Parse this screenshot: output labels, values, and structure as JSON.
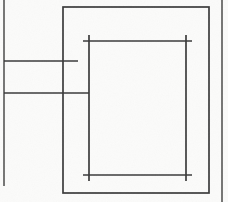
{
  "drawing": {
    "title": "Technical line drawing",
    "description": "Orthographic line diagram: nested rectangles with construction lines",
    "canvas": {
      "width": 228,
      "height": 202,
      "background_color": "#fbfbfa",
      "ink_color": "#3a3a3a",
      "secondary_ink_color": "#4a4a48",
      "stroke_width": 1.7
    },
    "elements": [
      {
        "name": "left-border-line",
        "kind": "line",
        "label": "Left vertical border line",
        "x1": 4,
        "y1": 0,
        "x2": 4,
        "y2": 186
      },
      {
        "name": "right-border-line",
        "kind": "line",
        "label": "Right vertical border line",
        "x1": 222,
        "y1": 0,
        "x2": 222,
        "y2": 202
      },
      {
        "name": "upper-horizontal-line",
        "kind": "line",
        "label": "Upper horizontal construction line",
        "x1": 4,
        "y1": 61,
        "x2": 78,
        "y2": 61
      },
      {
        "name": "lower-horizontal-line",
        "kind": "line",
        "label": "Lower horizontal construction line",
        "x1": 4,
        "y1": 93,
        "x2": 89,
        "y2": 93
      },
      {
        "name": "outer-rectangle",
        "kind": "rect",
        "label": "Outer rectangle",
        "x": 63,
        "y": 7,
        "width": 146,
        "height": 186
      },
      {
        "name": "inner-rect-top-edge",
        "kind": "line",
        "label": "Inner rectangle top edge",
        "x1": 83,
        "y1": 41,
        "x2": 192,
        "y2": 41
      },
      {
        "name": "inner-rect-bottom-edge",
        "kind": "line",
        "label": "Inner rectangle bottom edge",
        "x1": 83,
        "y1": 175,
        "x2": 192,
        "y2": 175
      },
      {
        "name": "inner-rect-left-edge",
        "kind": "line",
        "label": "Inner rectangle left edge",
        "x1": 89,
        "y1": 35,
        "x2": 89,
        "y2": 181
      },
      {
        "name": "inner-rect-right-edge",
        "kind": "line",
        "label": "Inner rectangle right edge",
        "x1": 186,
        "y1": 35,
        "x2": 186,
        "y2": 181
      }
    ],
    "corner_marks": [
      {
        "name": "inner-corner-mark-top-left",
        "x": 89,
        "y": 41
      },
      {
        "name": "inner-corner-mark-top-right",
        "x": 186,
        "y": 41
      },
      {
        "name": "inner-corner-mark-bottom-left",
        "x": 89,
        "y": 175
      },
      {
        "name": "inner-corner-mark-bottom-right",
        "x": 186,
        "y": 175
      }
    ]
  }
}
